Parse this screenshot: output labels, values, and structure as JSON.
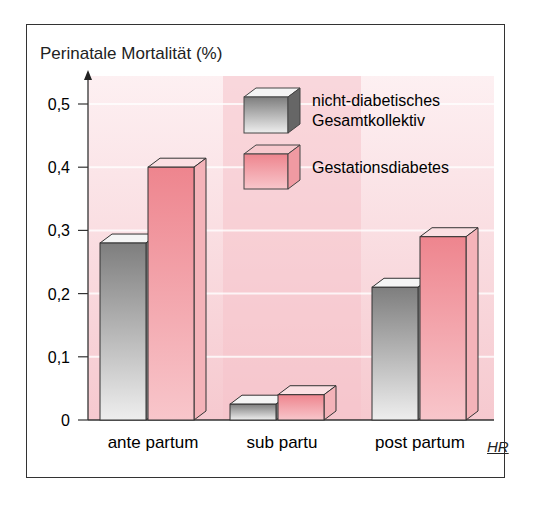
{
  "chart_data": {
    "type": "bar",
    "title": "",
    "ylabel": "Perinatale Mortalität (%)",
    "xlabel": "",
    "categories": [
      "ante partum",
      "sub partu",
      "post partum"
    ],
    "series": [
      {
        "name": "nicht-diabetisches Gesamtkollektiv",
        "values": [
          0.28,
          0.025,
          0.21
        ],
        "color": "#8a8a8a"
      },
      {
        "name": "Gestationsdiabetes",
        "values": [
          0.4,
          0.04,
          0.29
        ],
        "color": "#ee8b92"
      }
    ],
    "yticks": [
      "0",
      "0,1",
      "0,2",
      "0,3",
      "0,4",
      "0,5"
    ],
    "ylim": [
      0,
      0.5
    ],
    "grid": true,
    "legend_position": "top-right",
    "style": "3d-bars"
  },
  "labels": {
    "ytitle": "Perinatale Mortalität (%)",
    "legend_gray_line1": "nicht-diabetisches",
    "legend_gray_line2": "Gesamtkollektiv",
    "legend_red": "Gestationsdiabetes",
    "x": [
      "ante partum",
      "sub partu",
      "post partum"
    ],
    "yticks": [
      "0",
      "0,1",
      "0,2",
      "0,3",
      "0,4",
      "0,5"
    ],
    "logo": "HR"
  }
}
